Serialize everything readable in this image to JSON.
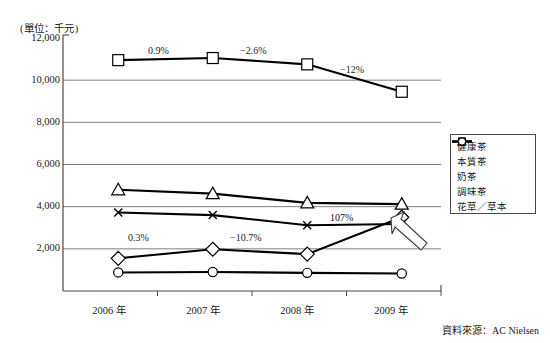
{
  "chart_data": {
    "type": "line",
    "title": "",
    "unit_label": "(單位：千元)",
    "xlabel": "",
    "ylabel": "",
    "categories": [
      "2006 年",
      "2007 年",
      "2008 年",
      "2009 年"
    ],
    "ylim": [
      0,
      12000
    ],
    "yticks": [
      "12,000",
      "10,000",
      "8,000",
      "6,000",
      "4,000",
      "2,000"
    ],
    "ytick_values": [
      12000,
      10000,
      8000,
      6000,
      4000,
      2000
    ],
    "grid": true,
    "legend_position": "right-middle",
    "series": [
      {
        "name": "健康茶",
        "marker": "diamond",
        "values": [
          1550,
          1980,
          1750,
          3500
        ]
      },
      {
        "name": "本質茶",
        "marker": "square",
        "values": [
          10950,
          11050,
          10750,
          9450
        ]
      },
      {
        "name": "奶茶",
        "marker": "triangle",
        "values": [
          4800,
          4620,
          4180,
          4120
        ]
      },
      {
        "name": "調味茶",
        "marker": "cross",
        "values": [
          3720,
          3600,
          3120,
          3180
        ]
      },
      {
        "name": "花草／草本",
        "marker": "circle",
        "values": [
          880,
          900,
          860,
          830
        ]
      }
    ],
    "annotations": [
      {
        "text": "0.9%",
        "series": "本質茶",
        "between": [
          "2006 年",
          "2007 年"
        ]
      },
      {
        "text": "−2.6%",
        "series": "本質茶",
        "between": [
          "2007 年",
          "2008 年"
        ]
      },
      {
        "text": "−12%",
        "series": "本質茶",
        "between": [
          "2008 年",
          "2009 年"
        ]
      },
      {
        "text": "0.3%",
        "series": "健康茶",
        "between": [
          "2006 年",
          "2007 年"
        ]
      },
      {
        "text": "−10.7%",
        "series": "健康茶",
        "between": [
          "2007 年",
          "2008 年"
        ]
      },
      {
        "text": "107%",
        "series": "健康茶",
        "between": [
          "2008 年",
          "2009 年"
        ]
      }
    ],
    "callout": {
      "shape": "block-arrow",
      "points_to": "2009 年 健康茶／調味茶"
    },
    "source_note": "資料來源：AC Nielsen",
    "colors": {
      "line": "#000000",
      "grid": "#808080",
      "axis": "#4a4a4a",
      "marker_fill": "#ffffff"
    }
  },
  "legend": {
    "items": [
      {
        "label": "健康茶",
        "marker": "diamond"
      },
      {
        "label": "本質茶",
        "marker": "square"
      },
      {
        "label": "奶茶",
        "marker": "triangle"
      },
      {
        "label": "調味茶",
        "marker": "cross"
      },
      {
        "label": "花草／草本",
        "marker": "circle"
      }
    ]
  }
}
